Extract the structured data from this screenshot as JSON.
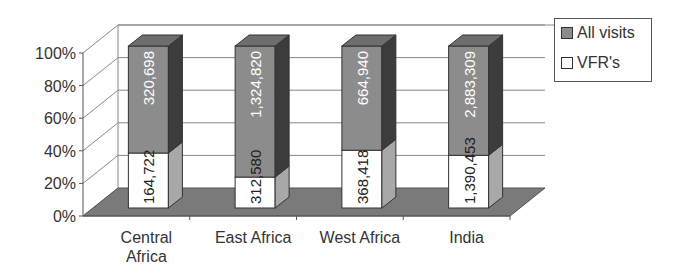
{
  "chart_data": {
    "type": "bar",
    "subtype": "stacked-100-percent-3d",
    "title": "",
    "xlabel": "",
    "ylabel": "",
    "categories": [
      "Central Africa",
      "East Africa",
      "West Africa",
      "India"
    ],
    "category_labels": [
      [
        "Central",
        "Africa"
      ],
      [
        "East Africa"
      ],
      [
        "West Africa"
      ],
      [
        "India"
      ]
    ],
    "series": [
      {
        "name": "VFR's",
        "values": [
          164722,
          312580,
          368418,
          1390453
        ],
        "labels": [
          "164,722",
          "312,580",
          "368,418",
          "1,390,453"
        ],
        "color": "#ffffff"
      },
      {
        "name": "All visits",
        "values": [
          320698,
          1324820,
          664940,
          2883309
        ],
        "labels": [
          "320,698",
          "1,324,820",
          "664,940",
          "2,883,309"
        ],
        "color": "#8a8a8a"
      }
    ],
    "y_ticks": [
      "0%",
      "20%",
      "40%",
      "60%",
      "80%",
      "100%"
    ],
    "ylim": [
      0,
      100
    ],
    "grid": true,
    "legend": {
      "position": "right-top",
      "entries": [
        "All visits",
        "VFR's"
      ]
    }
  },
  "colors": {
    "all_visits_front": "#8c8c8c",
    "all_visits_side": "#3c3c3c",
    "all_visits_top": "#6e6e6e",
    "vfr_front": "#ffffff",
    "vfr_side": "#a8a8a8",
    "floor": "#7a7a7a",
    "grid": "#888888",
    "text": "#333333"
  }
}
